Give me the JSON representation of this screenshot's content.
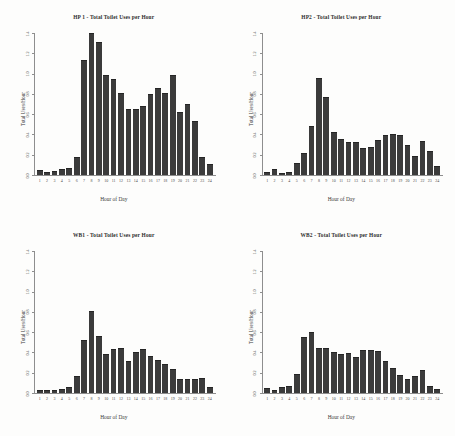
{
  "figure": {
    "axis_labels": {
      "x": "Hour of Day",
      "y": "Total Uses/Hour"
    },
    "y_ticks": [
      "0.0",
      "0.2",
      "0.4",
      "0.6",
      "0.8",
      "1.0",
      "1.2",
      "1.4"
    ],
    "hours": [
      "1",
      "2",
      "3",
      "4",
      "5",
      "6",
      "7",
      "8",
      "9",
      "10",
      "11",
      "12",
      "13",
      "14",
      "15",
      "16",
      "17",
      "18",
      "19",
      "20",
      "21",
      "22",
      "23",
      "24"
    ],
    "bar_color": "#3b3b3b",
    "axis_color": "#8e8e8e"
  },
  "panels": [
    {
      "id": "hp1",
      "title": "HP 1 - Total Toilet Uses per Hour"
    },
    {
      "id": "hp2",
      "title": "HP2 - Total Toilet Uses per Hour"
    },
    {
      "id": "wb1",
      "title": "WB1 - Total Toilet Uses per Hour"
    },
    {
      "id": "wb2",
      "title": "WB2 - Total Toilet Uses per Hour"
    }
  ],
  "chart_data": [
    {
      "type": "bar",
      "title": "HP 1 - Total Toilet Uses per Hour",
      "xlabel": "Hour of Day",
      "ylabel": "Total Uses/Hour",
      "categories": [
        "1",
        "2",
        "3",
        "4",
        "5",
        "6",
        "7",
        "8",
        "9",
        "10",
        "11",
        "12",
        "13",
        "14",
        "15",
        "16",
        "17",
        "18",
        "19",
        "20",
        "21",
        "22",
        "23",
        "24"
      ],
      "values": [
        0.04,
        0.02,
        0.03,
        0.05,
        0.06,
        0.17,
        1.13,
        1.4,
        1.31,
        0.98,
        0.94,
        0.8,
        0.65,
        0.65,
        0.68,
        0.79,
        0.85,
        0.8,
        0.98,
        0.62,
        0.7,
        0.53,
        0.17,
        0.1
      ],
      "ylim": [
        0.0,
        1.4
      ],
      "ytick_values": [
        0.0,
        0.2,
        0.4,
        0.6,
        0.8,
        1.0,
        1.2,
        1.4
      ],
      "grid": false,
      "legend": false
    },
    {
      "type": "bar",
      "title": "HP2 - Total Toilet Uses per Hour",
      "xlabel": "Hour of Day",
      "ylabel": "Total Uses/Hour",
      "categories": [
        "1",
        "2",
        "3",
        "4",
        "5",
        "6",
        "7",
        "8",
        "9",
        "10",
        "11",
        "12",
        "13",
        "14",
        "15",
        "16",
        "17",
        "18",
        "19",
        "20",
        "21",
        "22",
        "23",
        "24"
      ],
      "values": [
        0.02,
        0.05,
        0.01,
        0.02,
        0.11,
        0.21,
        0.48,
        0.95,
        0.76,
        0.42,
        0.35,
        0.32,
        0.32,
        0.26,
        0.27,
        0.34,
        0.39,
        0.4,
        0.39,
        0.29,
        0.18,
        0.33,
        0.23,
        0.08
      ],
      "ylim": [
        0.0,
        1.4
      ],
      "ytick_values": [
        0.0,
        0.2,
        0.4,
        0.6,
        0.8,
        1.0,
        1.2,
        1.4
      ],
      "grid": false,
      "legend": false
    },
    {
      "type": "bar",
      "title": "WB1 - Total Toilet Uses per Hour",
      "xlabel": "Hour of Day",
      "ylabel": "Total Uses/Hour",
      "categories": [
        "1",
        "2",
        "3",
        "4",
        "5",
        "6",
        "7",
        "8",
        "9",
        "10",
        "11",
        "12",
        "13",
        "14",
        "15",
        "16",
        "17",
        "18",
        "19",
        "20",
        "21",
        "22",
        "23",
        "24"
      ],
      "values": [
        0.02,
        0.02,
        0.02,
        0.03,
        0.05,
        0.16,
        0.52,
        0.8,
        0.56,
        0.38,
        0.43,
        0.44,
        0.31,
        0.4,
        0.43,
        0.36,
        0.32,
        0.28,
        0.23,
        0.13,
        0.13,
        0.13,
        0.14,
        0.05
      ],
      "ylim": [
        0.0,
        1.4
      ],
      "ytick_values": [
        0.0,
        0.2,
        0.4,
        0.6,
        0.8,
        1.0,
        1.2,
        1.4
      ],
      "grid": false,
      "legend": false
    },
    {
      "type": "bar",
      "title": "WB2 - Total Toilet Uses per Hour",
      "xlabel": "Hour of Day",
      "ylabel": "Total Uses/Hour",
      "categories": [
        "1",
        "2",
        "3",
        "4",
        "5",
        "6",
        "7",
        "8",
        "9",
        "10",
        "11",
        "12",
        "13",
        "14",
        "15",
        "16",
        "17",
        "18",
        "19",
        "20",
        "21",
        "22",
        "23",
        "24"
      ],
      "values": [
        0.04,
        0.02,
        0.05,
        0.06,
        0.18,
        0.55,
        0.6,
        0.44,
        0.44,
        0.4,
        0.38,
        0.39,
        0.35,
        0.42,
        0.42,
        0.41,
        0.31,
        0.24,
        0.17,
        0.13,
        0.16,
        0.22,
        0.06,
        0.03
      ],
      "ylim": [
        0.0,
        1.4
      ],
      "ytick_values": [
        0.0,
        0.2,
        0.4,
        0.6,
        0.8,
        1.0,
        1.2,
        1.4
      ],
      "grid": false,
      "legend": false
    }
  ]
}
